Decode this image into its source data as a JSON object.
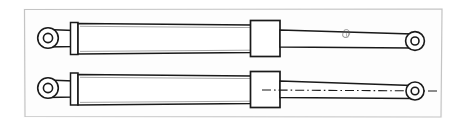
{
  "document": {
    "title": "Hydraulic Cylinder Assembly",
    "type": "technical-line-drawing",
    "view": "side elevation",
    "background_color": "#ffffff",
    "line_color": "#1a1a1a",
    "frame_color": "#c9c9c9",
    "paper_tint": "#fdfdfd",
    "canvas": {
      "width": 465,
      "height": 127
    }
  },
  "frame": {
    "name": "drawing-border",
    "x": 23,
    "y": 8,
    "width": 420,
    "height": 110,
    "stroke": "#c4c4c4",
    "stroke_width": 1.2
  },
  "views": [
    {
      "id": "upper-cylinder",
      "label": "Upper cylinder view",
      "centerline_y": 38,
      "has_centerline": false,
      "parts": [
        {
          "name": "left-eye-mount",
          "type": "eye",
          "cx": 48,
          "cy": 38,
          "outer_r": 10.5,
          "inner_r": 4.6
        },
        {
          "name": "eye-neck",
          "type": "neck",
          "x1": 55,
          "x2": 72,
          "half_height": 7.5
        },
        {
          "name": "end-cap-flange",
          "type": "flange",
          "x": 71,
          "y": 22,
          "width": 7,
          "height": 32
        },
        {
          "name": "barrel",
          "type": "tube",
          "x1": 78,
          "x2": 250,
          "left_half_height": 15.5,
          "right_half_height": 14.5
        },
        {
          "name": "gland-collar",
          "type": "box",
          "x": 250,
          "y": 20,
          "width": 30,
          "height": 36
        },
        {
          "name": "piston-rod",
          "type": "rod",
          "x1": 280,
          "x2": 408,
          "left_half_height": 8.5,
          "right_half_height": 7.0
        },
        {
          "name": "right-eye-mount",
          "type": "eye",
          "cx": 415,
          "cy": 41,
          "outer_r": 9.5,
          "inner_r": 4.0
        }
      ],
      "annotation": {
        "name": "pencil-smudge-mark",
        "x": 347,
        "y": 32,
        "description": "small hand-drawn scribble mark on rod"
      }
    },
    {
      "id": "lower-cylinder",
      "label": "Lower cylinder view",
      "centerline_y": 90,
      "has_centerline": true,
      "centerline": {
        "name": "axis-centerline",
        "x1": 262,
        "x2": 438,
        "y": 90,
        "style": "dash-dot",
        "stroke": "#1a1a1a"
      },
      "parts": [
        {
          "name": "left-eye-mount",
          "type": "eye",
          "cx": 48,
          "cy": 88,
          "outer_r": 10.5,
          "inner_r": 4.6
        },
        {
          "name": "eye-neck",
          "type": "neck",
          "x1": 55,
          "x2": 72,
          "half_height": 7.5
        },
        {
          "name": "end-cap-flange",
          "type": "flange",
          "x": 71,
          "y": 73,
          "width": 7,
          "height": 32
        },
        {
          "name": "barrel",
          "type": "tube",
          "x1": 78,
          "x2": 250,
          "left_half_height": 15.5,
          "right_half_height": 14.5
        },
        {
          "name": "gland-collar",
          "type": "box",
          "x": 250,
          "y": 72,
          "width": 30,
          "height": 36
        },
        {
          "name": "piston-rod",
          "type": "rod",
          "x1": 280,
          "x2": 408,
          "left_half_height": 8.5,
          "right_half_height": 7.5
        },
        {
          "name": "right-eye-mount",
          "type": "eye",
          "cx": 415,
          "cy": 91,
          "outer_r": 9.0,
          "inner_r": 3.8
        }
      ],
      "annotation": null
    }
  ],
  "legend": {
    "part_names": [
      "eye mount",
      "end cap flange",
      "barrel",
      "gland collar",
      "piston rod"
    ]
  }
}
